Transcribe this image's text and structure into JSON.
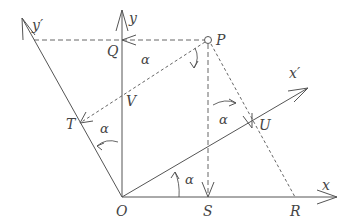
{
  "diagram": {
    "axes": {
      "x": "x",
      "y": "y",
      "x_prime": "x′",
      "y_prime": "y′"
    },
    "points": {
      "O": "O",
      "P": "P",
      "Q": "Q",
      "S": "S",
      "R": "R",
      "T": "T",
      "U": "U",
      "V": "V"
    },
    "angle_label": "α"
  }
}
